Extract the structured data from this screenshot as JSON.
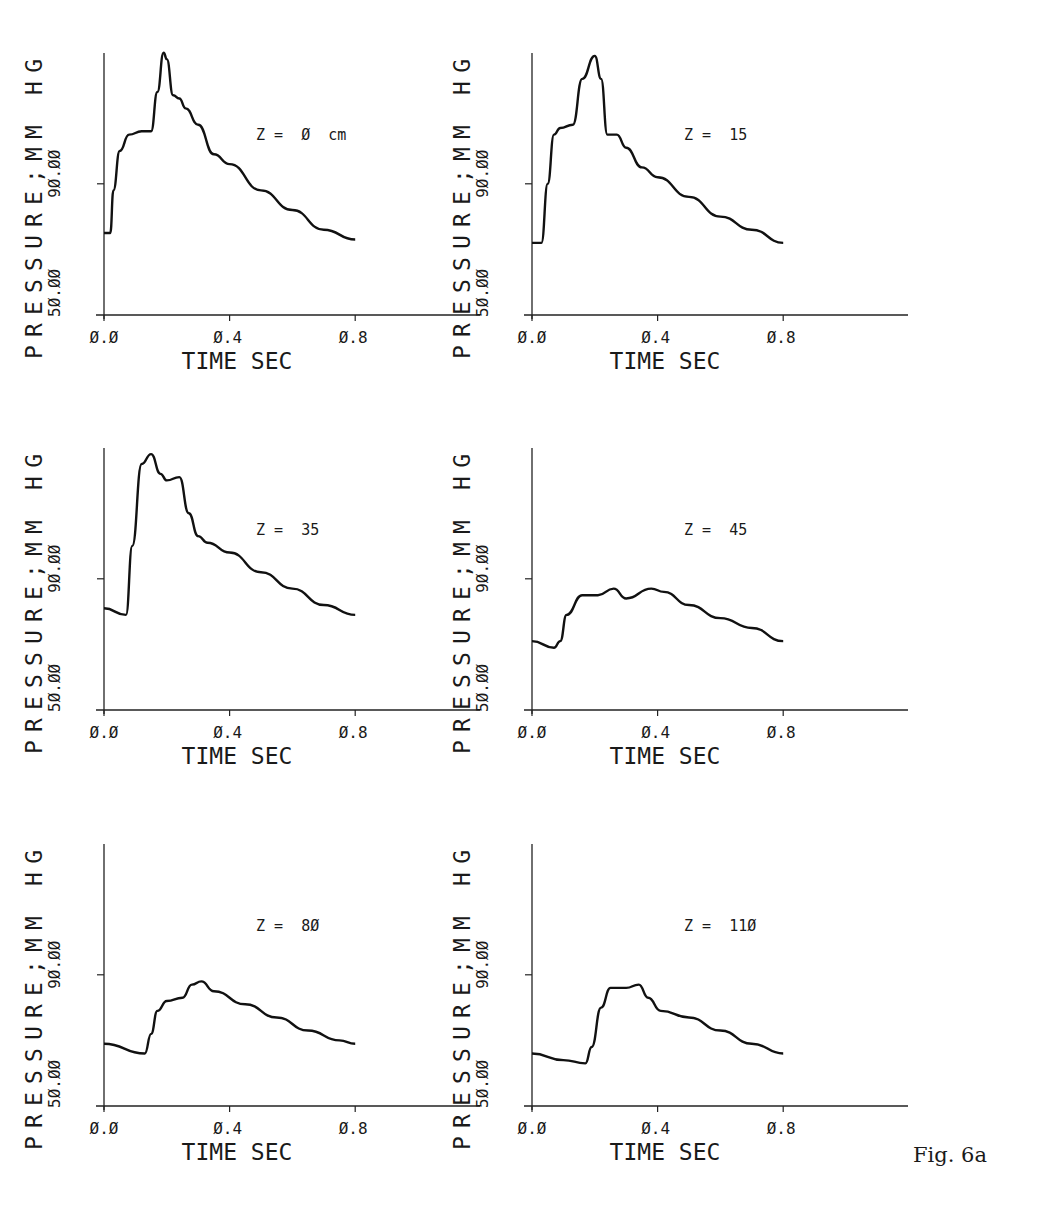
{
  "figure": {
    "caption": "Fig. 6a"
  },
  "chart_data": [
    {
      "type": "line",
      "panel": "top-left",
      "annotation": "Z =  Ø  cm",
      "xlabel": "TIME SEC",
      "ylabel": "PRESSURE;MM HG",
      "xticks": [
        "Ø.Ø",
        "Ø.4",
        "Ø.8"
      ],
      "yticks": [
        "5Ø.ØØ",
        "9Ø.ØØ"
      ],
      "xlim": [
        0,
        1.2
      ],
      "ylim": [
        50,
        130
      ],
      "x": [
        0.0,
        0.02,
        0.03,
        0.05,
        0.08,
        0.12,
        0.15,
        0.17,
        0.19,
        0.2,
        0.22,
        0.24,
        0.26,
        0.3,
        0.35,
        0.4,
        0.5,
        0.6,
        0.7,
        0.8
      ],
      "values": [
        75,
        75,
        88,
        100,
        105,
        106,
        106,
        118,
        130,
        128,
        117,
        116,
        113,
        108,
        99,
        96,
        88,
        82,
        76,
        73
      ]
    },
    {
      "type": "line",
      "panel": "top-right",
      "annotation": "Z =  15",
      "xlabel": "TIME SEC",
      "ylabel": "PRESSURE;MM HG",
      "xticks": [
        "Ø.Ø",
        "Ø.4",
        "Ø.8"
      ],
      "yticks": [
        "5Ø.ØØ",
        "9Ø.ØØ"
      ],
      "xlim": [
        0,
        1.2
      ],
      "ylim": [
        50,
        130
      ],
      "x": [
        0.0,
        0.03,
        0.05,
        0.07,
        0.09,
        0.13,
        0.16,
        0.2,
        0.22,
        0.24,
        0.27,
        0.3,
        0.35,
        0.4,
        0.5,
        0.6,
        0.7,
        0.8
      ],
      "values": [
        72,
        72,
        90,
        105,
        107,
        108,
        122,
        129,
        122,
        105,
        105,
        101,
        95,
        92,
        86,
        80,
        76,
        72
      ]
    },
    {
      "type": "line",
      "panel": "middle-left",
      "annotation": "Z =  35",
      "xlabel": "TIME SEC",
      "ylabel": "PRESSURE;MM HG",
      "xticks": [
        "Ø.Ø",
        "Ø.4",
        "Ø.8"
      ],
      "yticks": [
        "5Ø.ØØ",
        "9Ø.ØØ"
      ],
      "xlim": [
        0,
        1.2
      ],
      "ylim": [
        50,
        130
      ],
      "x": [
        0.0,
        0.07,
        0.09,
        0.12,
        0.15,
        0.18,
        0.2,
        0.24,
        0.27,
        0.3,
        0.33,
        0.4,
        0.5,
        0.6,
        0.7,
        0.8
      ],
      "values": [
        81,
        79,
        100,
        125,
        128,
        122,
        120,
        121,
        110,
        103,
        101,
        98,
        92,
        87,
        82,
        79
      ]
    },
    {
      "type": "line",
      "panel": "middle-right",
      "annotation": "Z =  45",
      "xlabel": "TIME SEC",
      "ylabel": "PRESSURE;MM HG",
      "xticks": [
        "Ø.Ø",
        "Ø.4",
        "Ø.8"
      ],
      "yticks": [
        "5Ø.ØØ",
        "9Ø.ØØ"
      ],
      "xlim": [
        0,
        1.2
      ],
      "ylim": [
        50,
        130
      ],
      "x": [
        0.0,
        0.07,
        0.09,
        0.11,
        0.16,
        0.21,
        0.26,
        0.3,
        0.38,
        0.42,
        0.5,
        0.6,
        0.7,
        0.8
      ],
      "values": [
        71,
        69,
        71,
        79,
        85,
        85,
        87,
        84,
        87,
        86,
        82,
        78,
        75,
        71
      ]
    },
    {
      "type": "line",
      "panel": "bottom-left",
      "annotation": "Z =  8Ø",
      "xlabel": "TIME SEC",
      "ylabel": "PRESSURE;MM HG",
      "xticks": [
        "Ø.Ø",
        "Ø.4",
        "Ø.8"
      ],
      "yticks": [
        "5Ø.ØØ",
        "9Ø.ØØ"
      ],
      "xlim": [
        0,
        1.2
      ],
      "ylim": [
        50,
        130
      ],
      "x": [
        0.0,
        0.13,
        0.15,
        0.17,
        0.2,
        0.25,
        0.28,
        0.31,
        0.35,
        0.45,
        0.55,
        0.65,
        0.75,
        0.8
      ],
      "values": [
        69,
        66,
        72,
        79,
        82,
        83,
        87,
        88,
        85,
        81,
        77,
        73,
        70,
        69
      ]
    },
    {
      "type": "line",
      "panel": "bottom-right",
      "annotation": "Z =  11Ø",
      "xlabel": "TIME SEC",
      "ylabel": "PRESSURE;MM HG",
      "xticks": [
        "Ø.Ø",
        "Ø.4",
        "Ø.8"
      ],
      "yticks": [
        "5Ø.ØØ",
        "9Ø.ØØ"
      ],
      "xlim": [
        0,
        1.2
      ],
      "ylim": [
        50,
        130
      ],
      "x": [
        0.0,
        0.1,
        0.17,
        0.19,
        0.22,
        0.25,
        0.3,
        0.34,
        0.37,
        0.41,
        0.5,
        0.6,
        0.7,
        0.8
      ],
      "values": [
        66,
        64,
        63,
        68,
        80,
        86,
        86,
        87,
        83,
        79,
        77,
        73,
        69,
        66
      ]
    }
  ]
}
